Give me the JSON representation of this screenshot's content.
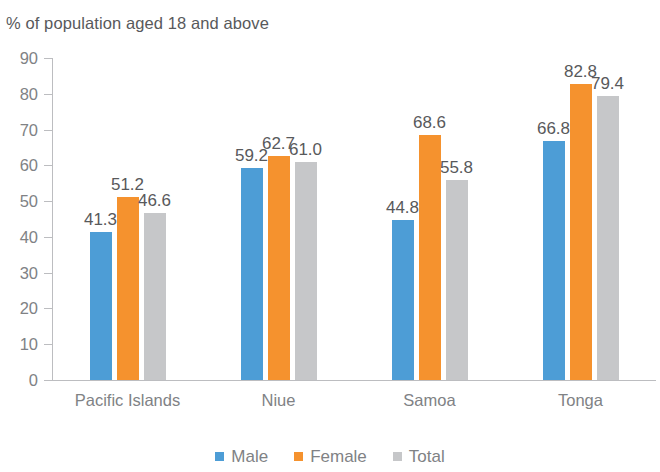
{
  "chart_data": {
    "type": "bar",
    "title": "% of population aged 18 and above",
    "xlabel": "",
    "ylabel": "",
    "ylim": [
      0,
      90
    ],
    "yticks": [
      0,
      10,
      20,
      30,
      40,
      50,
      60,
      70,
      80,
      90
    ],
    "ytick_labels": [
      "0",
      "10",
      "20",
      "30",
      "40",
      "50",
      "60",
      "70",
      "80",
      "90"
    ],
    "grid": false,
    "legend_position": "bottom-center",
    "categories": [
      "Pacific Islands",
      "Niue",
      "Samoa",
      "Tonga"
    ],
    "series": [
      {
        "name": "Male",
        "color": "#4d9dd6",
        "values": [
          41.3,
          59.2,
          44.8,
          66.8
        ],
        "labels": [
          "41.3",
          "59.2",
          "44.8",
          "66.8"
        ]
      },
      {
        "name": "Female",
        "color": "#f5922e",
        "values": [
          51.2,
          62.7,
          68.6,
          82.8
        ],
        "labels": [
          "51.2",
          "62.7",
          "68.6",
          "82.8"
        ]
      },
      {
        "name": "Total",
        "color": "#c6c7c9",
        "values": [
          46.6,
          61.0,
          55.8,
          79.4
        ],
        "labels": [
          "46.6",
          "61.0",
          "55.8",
          "79.4"
        ]
      }
    ]
  }
}
